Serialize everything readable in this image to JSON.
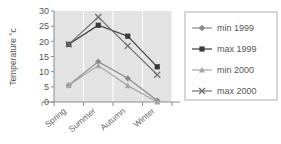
{
  "chart_data": {
    "type": "line",
    "title": "",
    "xlabel": "",
    "ylabel": "Temperature °c",
    "categories": [
      "Spring",
      "Summer",
      "Autumn",
      "Winter"
    ],
    "ylim": [
      0,
      30
    ],
    "yticks": [
      0,
      5,
      10,
      15,
      20,
      25,
      30
    ],
    "ytick_labels": [
      "0",
      "5",
      "10",
      "15",
      "20",
      "25",
      "30"
    ],
    "grid": "vertical",
    "legend_position": "right",
    "plot_background": "#e3e3e3",
    "series": [
      {
        "name": "min 1999",
        "marker": "diamond",
        "color": "#8a8a8a",
        "values": [
          5.5,
          13.3,
          7.8,
          0.5
        ]
      },
      {
        "name": "max 1999",
        "marker": "square",
        "color": "#3a3a3a",
        "values": [
          19.0,
          25.3,
          21.7,
          11.6
        ]
      },
      {
        "name": "min 2000",
        "marker": "triangle",
        "color": "#a6a6a6",
        "values": [
          5.5,
          12.0,
          5.4,
          0.0
        ]
      },
      {
        "name": "max 2000",
        "marker": "x",
        "color": "#707070",
        "values": [
          19.0,
          28.0,
          18.5,
          9.0
        ]
      }
    ]
  },
  "legend": {
    "items": [
      {
        "label": "min 1999"
      },
      {
        "label": "max 1999"
      },
      {
        "label": "min 2000"
      },
      {
        "label": "max 2000"
      }
    ]
  }
}
